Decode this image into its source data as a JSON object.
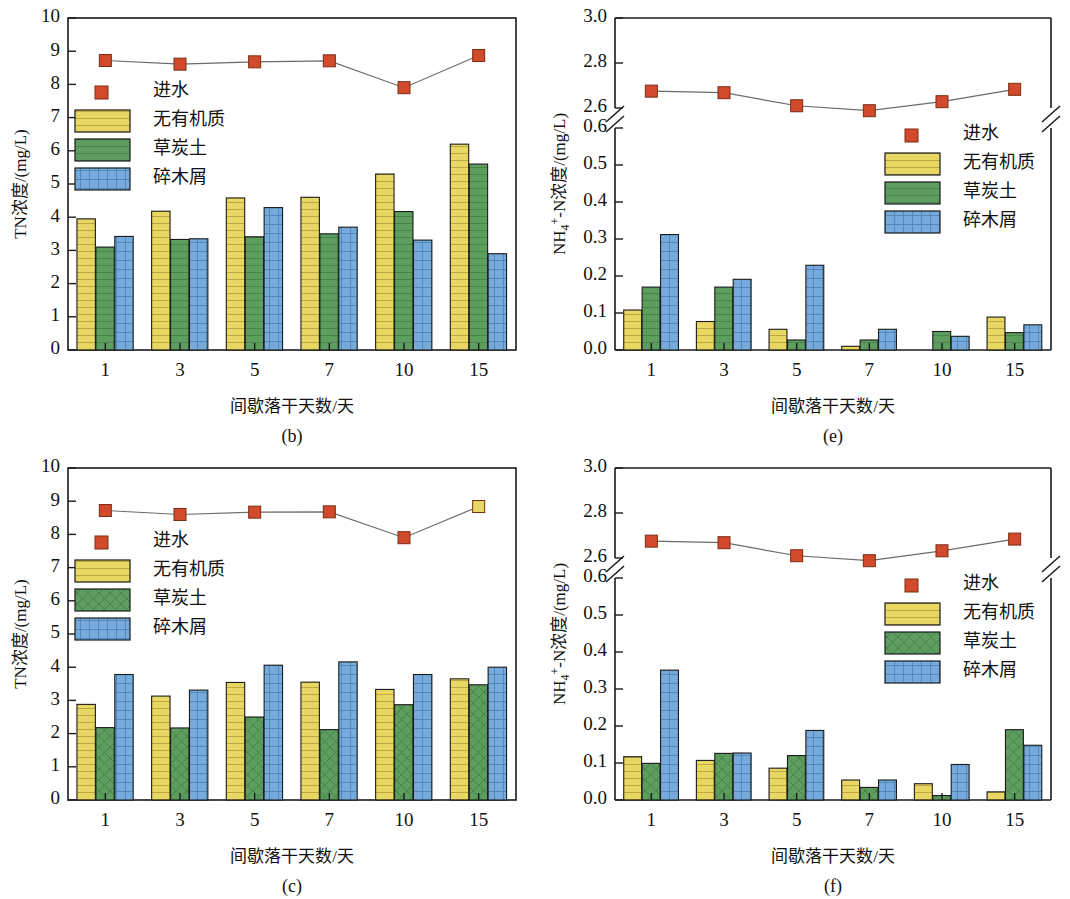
{
  "figure": {
    "panels": [
      "b",
      "e",
      "c",
      "f"
    ],
    "colors": {
      "inflow_marker": "#d24a2c",
      "no_organic": "#e9d763",
      "peat_soil": "#5d9e5f",
      "wood_chips": "#75aada",
      "outline": "#1a1a1a",
      "connector_line": "#6b6b6b"
    },
    "series_names": {
      "inflow": "进水",
      "no_organic": "无有机质",
      "peat_soil": "草炭土",
      "wood_chips": "碎木屑"
    },
    "xlabel": "间歇落干天数/天",
    "ylabel_tn": "TN浓度/(mg/L)",
    "ylabel_nh4": "NH₄⁺-N浓度/(mg/L)"
  },
  "chart_data": [
    {
      "id": "b",
      "panel_label": "(b)",
      "type": "bar",
      "title": "",
      "xlabel": "间歇落干天数/天",
      "ylabel": "TN浓度/(mg/L)",
      "categories": [
        "1",
        "3",
        "5",
        "7",
        "10",
        "15"
      ],
      "ylim": [
        0,
        10
      ],
      "yticks": [
        0,
        1,
        2,
        3,
        4,
        5,
        6,
        7,
        8,
        9,
        10
      ],
      "broken_axis": false,
      "grid": false,
      "legend_position": "upper-left",
      "series": [
        {
          "name": "无有机质",
          "type": "bar",
          "values": [
            3.95,
            4.18,
            4.58,
            4.6,
            5.3,
            6.2
          ]
        },
        {
          "name": "草炭土",
          "type": "bar",
          "values": [
            3.1,
            3.33,
            3.41,
            3.5,
            4.17,
            5.6
          ]
        },
        {
          "name": "碎木屑",
          "type": "bar",
          "values": [
            3.42,
            3.35,
            4.29,
            3.7,
            3.31,
            2.9
          ]
        },
        {
          "name": "进水",
          "type": "line-marker",
          "values": [
            8.72,
            8.61,
            8.68,
            8.71,
            7.9,
            8.87
          ]
        }
      ]
    },
    {
      "id": "e",
      "panel_label": "(e)",
      "type": "bar",
      "title": "",
      "xlabel": "间歇落干天数/天",
      "ylabel": "NH₄⁺-N浓度/(mg/L)",
      "categories": [
        "1",
        "3",
        "5",
        "7",
        "10",
        "15"
      ],
      "broken_axis": true,
      "ylim_lower": [
        0.0,
        0.6
      ],
      "yticks_lower": [
        0.0,
        0.1,
        0.2,
        0.3,
        0.4,
        0.5,
        0.6
      ],
      "ylim_upper": [
        2.6,
        3.0
      ],
      "yticks_upper": [
        2.6,
        2.8,
        3.0
      ],
      "grid": false,
      "legend_position": "upper-right",
      "series": [
        {
          "name": "无有机质",
          "type": "bar",
          "values": [
            0.108,
            0.077,
            0.056,
            0.01,
            null,
            0.089
          ]
        },
        {
          "name": "草炭土",
          "type": "bar",
          "values": [
            0.17,
            0.17,
            0.027,
            0.027,
            0.05,
            0.047
          ]
        },
        {
          "name": "碎木屑",
          "type": "bar",
          "values": [
            0.312,
            0.191,
            0.229,
            0.056,
            0.037,
            0.068
          ]
        },
        {
          "name": "进水",
          "type": "line-marker",
          "values": [
            2.675,
            2.668,
            2.61,
            2.588,
            2.628,
            2.683
          ]
        }
      ]
    },
    {
      "id": "c",
      "panel_label": "(c)",
      "type": "bar",
      "title": "",
      "xlabel": "间歇落干天数/天",
      "ylabel": "TN浓度/(mg/L)",
      "categories": [
        "1",
        "3",
        "5",
        "7",
        "10",
        "15"
      ],
      "ylim": [
        0,
        10
      ],
      "yticks": [
        0,
        1,
        2,
        3,
        4,
        5,
        6,
        7,
        8,
        9,
        10
      ],
      "broken_axis": false,
      "grid": false,
      "legend_position": "upper-left",
      "series": [
        {
          "name": "无有机质",
          "type": "bar",
          "values": [
            2.88,
            3.13,
            3.54,
            3.55,
            3.33,
            3.65
          ]
        },
        {
          "name": "草炭土",
          "type": "bar",
          "values": [
            2.18,
            2.17,
            2.5,
            2.12,
            2.87,
            3.47
          ]
        },
        {
          "name": "碎木屑",
          "type": "bar",
          "values": [
            3.78,
            3.31,
            4.06,
            4.16,
            3.78,
            4.0
          ]
        },
        {
          "name": "进水",
          "type": "line-marker",
          "values": [
            8.72,
            8.6,
            8.67,
            8.68,
            7.9,
            8.84
          ]
        }
      ]
    },
    {
      "id": "f",
      "panel_label": "(f)",
      "type": "bar",
      "title": "",
      "xlabel": "间歇落干天数/天",
      "ylabel": "NH₄⁺-N浓度/(mg/L)",
      "categories": [
        "1",
        "3",
        "5",
        "7",
        "10",
        "15"
      ],
      "broken_axis": true,
      "ylim_lower": [
        0.0,
        0.6
      ],
      "yticks_lower": [
        0.0,
        0.1,
        0.2,
        0.3,
        0.4,
        0.5,
        0.6
      ],
      "ylim_upper": [
        2.6,
        3.0
      ],
      "yticks_upper": [
        2.6,
        2.8,
        3.0
      ],
      "grid": false,
      "legend_position": "upper-right",
      "series": [
        {
          "name": "无有机质",
          "type": "bar",
          "values": [
            0.117,
            0.107,
            0.086,
            0.054,
            0.044,
            0.022
          ]
        },
        {
          "name": "草炭土",
          "type": "bar",
          "values": [
            0.099,
            0.126,
            0.12,
            0.034,
            0.012,
            0.19
          ]
        },
        {
          "name": "碎木屑",
          "type": "bar",
          "values": [
            0.351,
            0.127,
            0.188,
            0.054,
            0.096,
            0.148
          ]
        },
        {
          "name": "进水",
          "type": "line-marker",
          "values": [
            2.675,
            2.668,
            2.61,
            2.588,
            2.632,
            2.684
          ]
        }
      ]
    }
  ]
}
